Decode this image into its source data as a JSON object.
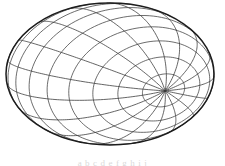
{
  "figure": {
    "background_color": "#ffffff",
    "line_color": "#3a3a3a",
    "outline_color": "#1c1c1c",
    "outline_width": 1.5,
    "mesh_line_width": 0.85,
    "ellipse": {
      "center_x": 110,
      "center_y": 74,
      "radius_x": 104,
      "radius_y": 71
    },
    "mesh": {
      "family_a_name": "meridian-curves",
      "family_a_count": 17,
      "family_b_name": "parallel-curves",
      "family_b_count": 13,
      "twist": 1.15,
      "samples": 120
    },
    "caption": {
      "text": "a b c d e f g h i j",
      "visible": "clipped"
    }
  }
}
